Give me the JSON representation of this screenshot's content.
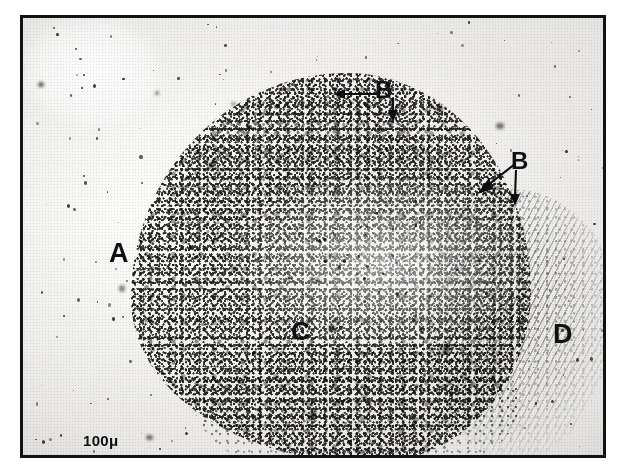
{
  "figure": {
    "kind": "micrograph",
    "frame_color": "#121212",
    "background_color": "#f4f3f1",
    "grain_color": "#2a2826"
  },
  "labels": [
    {
      "id": "A",
      "text": "A",
      "meaning": "sparse-region-left"
    },
    {
      "id": "B1",
      "text": "B",
      "meaning": "arrowed-feature-top"
    },
    {
      "id": "B2",
      "text": "B",
      "meaning": "arrowed-feature-right"
    },
    {
      "id": "C",
      "text": "C",
      "meaning": "dense-mass-center"
    },
    {
      "id": "D",
      "text": "D",
      "meaning": "streaky-region-right"
    }
  ],
  "arrows": [
    {
      "id": "b1-left",
      "points": "left",
      "belongs_to": "B1"
    },
    {
      "id": "b1-down",
      "points": "down",
      "belongs_to": "B1"
    },
    {
      "id": "b2-diag",
      "points": "down-left",
      "belongs_to": "B2"
    },
    {
      "id": "b2-down",
      "points": "down",
      "belongs_to": "B2"
    }
  ],
  "scale_bar": {
    "value": "100",
    "unit": "μ",
    "label": "100μ",
    "length_px": 46
  }
}
